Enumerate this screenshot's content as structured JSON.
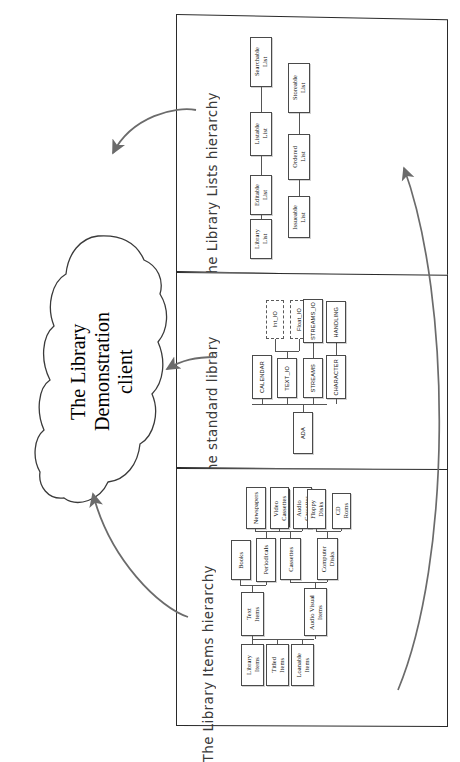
{
  "diagram": {
    "title": "The Library Demonstration client",
    "cloud_label": "The Library\nDemonstration\nclient",
    "ink_color": "#2a2a2a",
    "arrow_color": "#6b6b6b",
    "box_border_color": "#4a4a4a"
  },
  "panels": [
    {
      "id": "lists",
      "caption": "The Library Lists hierarchy"
    },
    {
      "id": "std",
      "caption": "The standard library"
    },
    {
      "id": "items",
      "caption": "The Library Items hierarchy"
    }
  ],
  "lists_hierarchy": {
    "caption": "The Library Lists hierarchy",
    "chain_a": [
      "Library\nList",
      "Editable\nList",
      "Listable\nList",
      "Searchable\nList"
    ],
    "chain_b": [
      "Issueable\nList",
      "Ordered\nList",
      "Storeable\nList"
    ]
  },
  "standard_library": {
    "caption": "The standard library",
    "root": "ADA",
    "children": [
      "CALENDAR",
      "TEXT_IO",
      "STREAMS",
      "CHARACTER"
    ],
    "text_io_children": [
      "Int_IO",
      "Float_IO"
    ],
    "streams_children": [
      "STREAMS_IO"
    ],
    "character_children": [
      "HANDLING"
    ],
    "dashed_nodes": [
      "Int_IO",
      "Float_IO"
    ]
  },
  "items_hierarchy": {
    "caption": "The Library Items hierarchy",
    "roots": [
      "Library\nItems",
      "Titled\nItems",
      "Loanable\nItems"
    ],
    "mid": [
      "Text\nItems",
      "Audio Visual\nItems"
    ],
    "text_children": [
      "Books",
      "Periodicals"
    ],
    "periodicals_children": [
      "Newspapers",
      "Journals"
    ],
    "av_children": [
      "Cassettes",
      "Computer\nDisks"
    ],
    "cassettes_children": [
      "Video\nCassettes",
      "Audio\nCassettes"
    ],
    "disks_children": [
      "Floppy\nDisks",
      "CD\nRoms"
    ]
  },
  "arrows": [
    {
      "name": "lists-to-client",
      "from": "The Library Lists hierarchy",
      "to": "The Library Demonstration client"
    },
    {
      "name": "std-to-client",
      "from": "The standard library",
      "to": "The Library Demonstration client"
    },
    {
      "name": "items-to-client",
      "from": "The Library Items hierarchy",
      "to": "The Library Demonstration client"
    },
    {
      "name": "items-to-lists",
      "from": "The Library Items hierarchy",
      "to": "The Library Lists hierarchy"
    }
  ]
}
